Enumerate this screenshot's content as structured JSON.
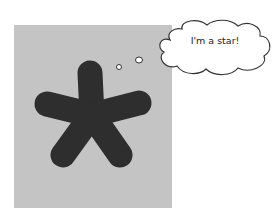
{
  "thought_bubble": {
    "text": "I'm a star!"
  },
  "colors": {
    "panel": "#c4c4c4",
    "star": "#2e2e2e",
    "bubble_fill": "#ffffff",
    "bubble_stroke": "#333333"
  }
}
